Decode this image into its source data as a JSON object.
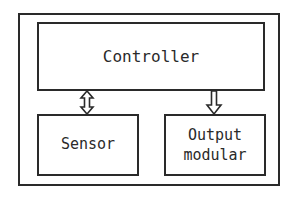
{
  "diagram": {
    "type": "block-diagram",
    "nodes": [
      {
        "id": "controller",
        "label": "Controller"
      },
      {
        "id": "sensor",
        "label": "Sensor"
      },
      {
        "id": "output",
        "label_lines": [
          "Output",
          "modular"
        ]
      }
    ],
    "edges": [
      {
        "from": "controller",
        "to": "sensor",
        "style": "bidirectional-hollow-arrow"
      },
      {
        "from": "controller",
        "to": "output",
        "style": "unidirectional-hollow-arrow"
      }
    ]
  },
  "colors": {
    "stroke": "#2a2a2a",
    "background": "#ffffff"
  }
}
